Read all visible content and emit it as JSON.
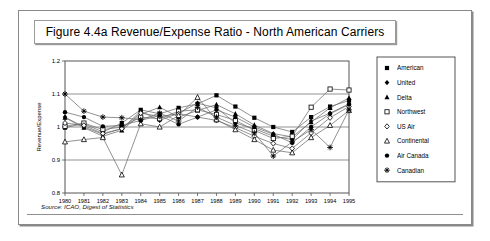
{
  "figure": {
    "title": "Figure 4.4a Revenue/Expense Ratio - North American Carriers",
    "source": "Source:  ICAO, Digest of Statistics"
  },
  "chart_data": {
    "type": "line",
    "title": "Figure 4.4a Revenue/Expense Ratio - North American Carriers",
    "xlabel": "Year",
    "ylabel": "Revenue/Expense",
    "categories": [
      "1980",
      "1981",
      "1982",
      "1983",
      "1984",
      "1985",
      "1986",
      "1987",
      "1988",
      "1989",
      "1990",
      "1991",
      "1992",
      "1993",
      "1994",
      "1995"
    ],
    "ylim": [
      0.8,
      1.2
    ],
    "yticks": [
      0.8,
      0.9,
      1.0,
      1.1,
      1.2
    ],
    "ytick_labels": [
      "0.8",
      "0.9",
      "1",
      "1.1",
      "1.2"
    ],
    "grid": true,
    "gridlines_at": [
      0.9,
      1.0,
      1.1
    ],
    "legend_position": "right",
    "series": [
      {
        "name": "American",
        "marker": "filled-square",
        "values": [
          0.998,
          1.01,
          0.985,
          1.012,
          1.052,
          1.04,
          1.058,
          1.07,
          1.096,
          1.062,
          1.028,
          1.0,
          0.985,
          1.03,
          1.062,
          1.08
        ]
      },
      {
        "name": "United",
        "marker": "filled-diamond",
        "values": [
          1.03,
          1.0,
          0.978,
          0.995,
          1.048,
          1.02,
          1.042,
          1.072,
          1.058,
          1.012,
          0.995,
          0.972,
          0.962,
          1.018,
          1.042,
          1.07
        ]
      },
      {
        "name": "Delta",
        "marker": "filled-triangle",
        "values": [
          1.028,
          0.998,
          0.972,
          0.99,
          1.038,
          1.06,
          1.03,
          1.05,
          1.068,
          1.04,
          1.006,
          0.98,
          0.97,
          1.015,
          1.058,
          1.088
        ]
      },
      {
        "name": "Northwest",
        "marker": "open-square",
        "values": [
          1.002,
          1.012,
          0.992,
          1.0,
          1.03,
          1.025,
          1.048,
          1.052,
          1.038,
          1.02,
          0.99,
          0.965,
          0.972,
          1.06,
          1.115,
          1.112
        ]
      },
      {
        "name": "US Air",
        "marker": "open-diamond",
        "values": [
          1.012,
          1.005,
          0.98,
          0.995,
          1.042,
          1.032,
          1.04,
          1.03,
          1.02,
          0.998,
          0.972,
          0.95,
          0.935,
          0.982,
          1.028,
          1.062
        ]
      },
      {
        "name": "Continental",
        "marker": "open-triangle",
        "values": [
          0.955,
          0.962,
          0.968,
          0.855,
          1.01,
          1.0,
          1.035,
          1.09,
          1.022,
          0.992,
          0.962,
          0.93,
          0.922,
          0.968,
          1.005,
          1.05
        ]
      },
      {
        "name": "Air Canada",
        "marker": "filled-circle",
        "values": [
          1.045,
          1.03,
          1.002,
          1.005,
          1.02,
          1.035,
          1.008,
          1.03,
          1.052,
          1.03,
          1.0,
          0.978,
          0.952,
          1.0,
          1.04,
          1.068
        ]
      },
      {
        "name": "Canadian",
        "marker": "star",
        "values": [
          1.1,
          1.048,
          1.03,
          1.028,
          1.022,
          1.042,
          1.018,
          1.06,
          1.03,
          1.005,
          0.982,
          0.912,
          0.955,
          0.992,
          0.938,
          1.052
        ]
      }
    ]
  },
  "legend": {
    "items": [
      {
        "label": "American"
      },
      {
        "label": "United"
      },
      {
        "label": "Delta"
      },
      {
        "label": "Northwest"
      },
      {
        "label": "US Air"
      },
      {
        "label": "Continental"
      },
      {
        "label": "Air Canada"
      },
      {
        "label": "Canadian"
      }
    ]
  }
}
